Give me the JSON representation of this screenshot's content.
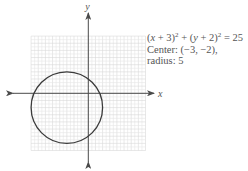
{
  "diagram": {
    "type": "circle-on-coordinate-plane",
    "axes": {
      "x_label": "x",
      "y_label": "y",
      "x_range": [
        -8,
        8
      ],
      "y_range": [
        -8,
        8
      ],
      "grid": true,
      "arrows": true
    },
    "circle": {
      "center": [
        -3,
        -2
      ],
      "radius": 5
    },
    "layout": {
      "origin_px": [
        88.3,
        93.3
      ],
      "unit_px": 7.15,
      "grid_step_units": 0.5,
      "x_axis_px": [
        13,
        154
      ],
      "y_axis_px": [
        13,
        162
      ]
    },
    "colors": {
      "curve": "#3a3a3a",
      "axis": "#4a4a4a",
      "grid": "#e6e6e6",
      "grid_major": "#d9d9d9",
      "text": "#555555"
    }
  },
  "annotation": {
    "equation_parts": {
      "lp1": "(",
      "var1": "x",
      "plus1": " + 3)",
      "exp1": "2",
      "mid": " + (",
      "var2": "y",
      "plus2": " + 2)",
      "exp2": "2",
      "rhs": " = 25"
    },
    "center_line": "Center: (−3, −2),",
    "radius_line": "radius: 5"
  }
}
